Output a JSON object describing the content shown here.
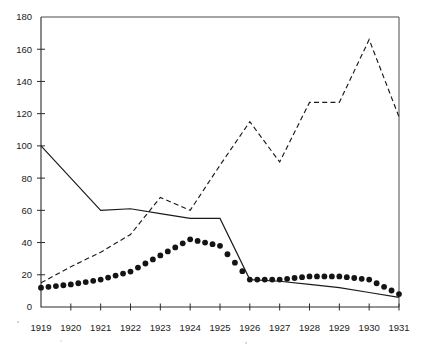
{
  "chart": {
    "title": "",
    "type": "line",
    "background_color": "#ffffff",
    "axis_color": "#2b2b2b"
  },
  "axes": {
    "y_ticks": [
      "0",
      "20",
      "40",
      "60",
      "80",
      "100",
      "120",
      "140",
      "160",
      "180"
    ],
    "x_ticks": [
      "1919",
      "1920",
      "1921",
      "1922",
      "1923",
      "1924",
      "1925",
      "1926",
      "1927",
      "1928",
      "1929",
      "1930",
      "1931"
    ],
    "ylim": [
      0,
      180
    ],
    "xlim": [
      "1919",
      "1931"
    ]
  },
  "chart_data": {
    "type": "line",
    "title": "",
    "xlabel": "",
    "ylabel": "",
    "ylim": [
      0,
      180
    ],
    "grid": false,
    "legend": "none",
    "x": [
      1919,
      1920,
      1921,
      1922,
      1923,
      1924,
      1925,
      1926,
      1927,
      1928,
      1929,
      1930,
      1931
    ],
    "categories": [
      "1919",
      "1920",
      "1921",
      "1922",
      "1923",
      "1924",
      "1925",
      "1926",
      "1927",
      "1928",
      "1929",
      "1930",
      "1931"
    ],
    "series": [
      {
        "name": "solid-line",
        "style": "solid",
        "color": "#1a1a1a",
        "values": [
          100,
          80,
          60,
          61,
          58,
          55,
          55,
          17,
          16,
          14,
          12,
          9,
          6
        ]
      },
      {
        "name": "dashed-line",
        "style": "dashed",
        "color": "#1a1a1a",
        "values": [
          15,
          25,
          34,
          45,
          68,
          60,
          88,
          115,
          90,
          127,
          127,
          166,
          118
        ]
      },
      {
        "name": "dotted-line",
        "style": "dotted-markers",
        "color": "#141414",
        "values": [
          12,
          14,
          17,
          22,
          32,
          42,
          38,
          17,
          17,
          19,
          19,
          17,
          8
        ]
      }
    ]
  }
}
